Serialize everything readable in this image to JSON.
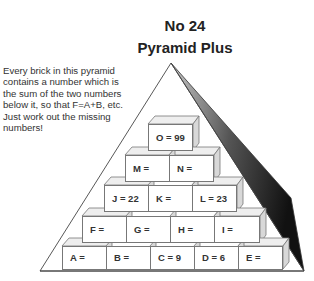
{
  "header": {
    "number": "No 24",
    "title": "Pyramid Plus"
  },
  "instructions": "Every brick in this pyramid contains a number which is the sum of the two numbers below it, so that F=A+B, etc. Just work out the missing numbers!",
  "pyramid": {
    "row5": [
      {
        "label": "O = 99"
      }
    ],
    "row4": [
      {
        "label": "M ="
      },
      {
        "label": "N ="
      }
    ],
    "row3": [
      {
        "label": "J = 22"
      },
      {
        "label": "K ="
      },
      {
        "label": "L = 23"
      }
    ],
    "row2": [
      {
        "label": "F ="
      },
      {
        "label": "G ="
      },
      {
        "label": "H ="
      },
      {
        "label": "I ="
      }
    ],
    "row1": [
      {
        "label": "A ="
      },
      {
        "label": "B ="
      },
      {
        "label": "C = 9"
      },
      {
        "label": "D = 6"
      },
      {
        "label": "E ="
      }
    ]
  }
}
